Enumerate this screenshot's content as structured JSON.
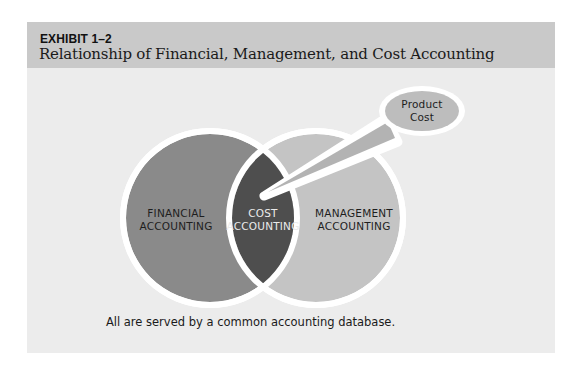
{
  "exhibit": {
    "number": "EXHIBIT 1–2",
    "title": "Relationship of Financial, Management, and Cost Accounting"
  },
  "diagram": {
    "type": "venn",
    "circles": [
      {
        "id": "financial",
        "label_lines": [
          "FINANCIAL",
          "ACCOUNTING"
        ],
        "fill": "#8a8a8a"
      },
      {
        "id": "management",
        "label_lines": [
          "MANAGEMENT",
          "ACCOUNTING"
        ],
        "fill": "#c4c4c4"
      }
    ],
    "intersection": {
      "id": "cost",
      "label_lines": [
        "COST",
        "ACCOUNTING"
      ],
      "fill": "#4e4e4e"
    },
    "callout": {
      "label_lines": [
        "Product",
        "Cost"
      ],
      "fill": "#bdbdbd",
      "points_to": "cost"
    },
    "ring_color": "#ffffff"
  },
  "caption": "All are served by a common accounting database.",
  "colors": {
    "header_bg": "#c9c9c9",
    "panel_bg": "#ececec",
    "label_dark": "#1e1e1e",
    "label_light": "#ebebeb"
  }
}
